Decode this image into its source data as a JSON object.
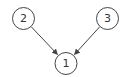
{
  "diagram": {
    "type": "directed-graph",
    "nodes": [
      {
        "id": "n1",
        "label": "1",
        "cx": 66,
        "cy": 63.5,
        "r": 11
      },
      {
        "id": "n2",
        "label": "2",
        "cx": 23.5,
        "cy": 18.5,
        "r": 11
      },
      {
        "id": "n3",
        "label": "3",
        "cx": 107.5,
        "cy": 18.5,
        "r": 11
      }
    ],
    "edges": [
      {
        "from": "2",
        "to": "1"
      },
      {
        "from": "3",
        "to": "1"
      }
    ],
    "colors": {
      "stroke": "#444444",
      "text": "#333333",
      "background": "#ffffff"
    }
  }
}
